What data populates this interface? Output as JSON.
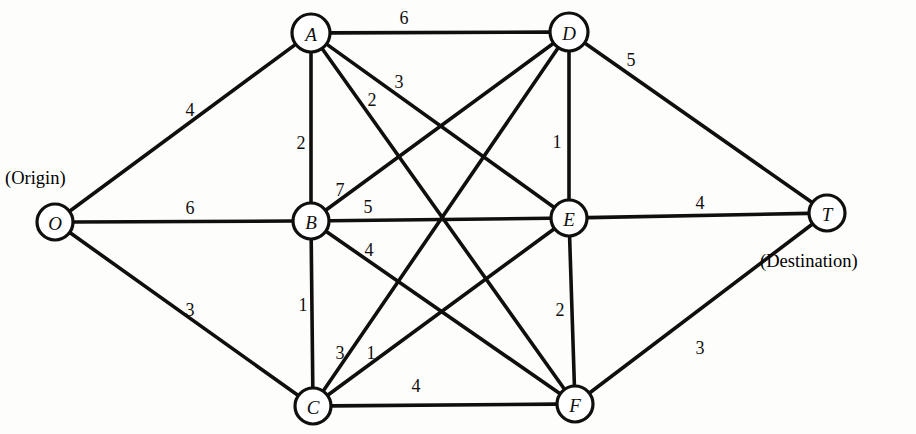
{
  "diagram": {
    "type": "undirected-weighted-network",
    "title_text": "",
    "annotations": [
      {
        "name": "origin-annotation",
        "text": "(Origin)",
        "x": 5,
        "y": 168
      },
      {
        "name": "destination-annotation",
        "text": "(Destination)",
        "x": 760,
        "y": 251
      }
    ],
    "nodes": [
      {
        "id": "O",
        "label": "O",
        "x": 55,
        "y": 222,
        "r": 18
      },
      {
        "id": "A",
        "label": "A",
        "x": 311,
        "y": 33,
        "r": 19
      },
      {
        "id": "B",
        "label": "B",
        "x": 311,
        "y": 221,
        "r": 18
      },
      {
        "id": "C",
        "label": "C",
        "x": 313,
        "y": 406,
        "r": 18
      },
      {
        "id": "D",
        "label": "D",
        "x": 569,
        "y": 32,
        "r": 19
      },
      {
        "id": "E",
        "label": "E",
        "x": 569,
        "y": 218,
        "r": 18
      },
      {
        "id": "F",
        "label": "F",
        "x": 575,
        "y": 404,
        "r": 18
      },
      {
        "id": "T",
        "label": "T",
        "x": 827,
        "y": 213,
        "r": 18
      }
    ],
    "edges": [
      {
        "from": "O",
        "to": "A",
        "weight": "4",
        "lx": 190,
        "ly": 110
      },
      {
        "from": "O",
        "to": "B",
        "weight": "6",
        "lx": 190,
        "ly": 208
      },
      {
        "from": "O",
        "to": "C",
        "weight": "3",
        "lx": 190,
        "ly": 310
      },
      {
        "from": "A",
        "to": "D",
        "weight": "6",
        "lx": 404,
        "ly": 18
      },
      {
        "from": "A",
        "to": "B",
        "weight": "2",
        "lx": 301,
        "ly": 143
      },
      {
        "from": "A",
        "to": "E",
        "weight": "2",
        "lx": 372,
        "ly": 100
      },
      {
        "from": "A",
        "to": "F",
        "weight": "3",
        "lx": 399,
        "ly": 82
      },
      {
        "from": "B",
        "to": "D",
        "weight": "7",
        "lx": 340,
        "ly": 190
      },
      {
        "from": "B",
        "to": "E",
        "weight": "5",
        "lx": 368,
        "ly": 207
      },
      {
        "from": "B",
        "to": "F",
        "weight": "4",
        "lx": 369,
        "ly": 250
      },
      {
        "from": "B",
        "to": "C",
        "weight": "1",
        "lx": 303,
        "ly": 305
      },
      {
        "from": "C",
        "to": "D",
        "weight": "3",
        "lx": 340,
        "ly": 353
      },
      {
        "from": "C",
        "to": "E",
        "weight": "1",
        "lx": 371,
        "ly": 353
      },
      {
        "from": "C",
        "to": "F",
        "weight": "4",
        "lx": 416,
        "ly": 386
      },
      {
        "from": "D",
        "to": "E",
        "weight": "1",
        "lx": 557,
        "ly": 142
      },
      {
        "from": "D",
        "to": "T",
        "weight": "5",
        "lx": 631,
        "ly": 60
      },
      {
        "from": "E",
        "to": "F",
        "weight": "2",
        "lx": 560,
        "ly": 310
      },
      {
        "from": "E",
        "to": "T",
        "weight": "4",
        "lx": 700,
        "ly": 203
      },
      {
        "from": "F",
        "to": "T",
        "weight": "3",
        "lx": 700,
        "ly": 348
      }
    ],
    "style": {
      "line_color": "#100f0d",
      "node_fill": "#ffffff",
      "background": "#fdfdfb",
      "line_width": 3.6
    }
  }
}
